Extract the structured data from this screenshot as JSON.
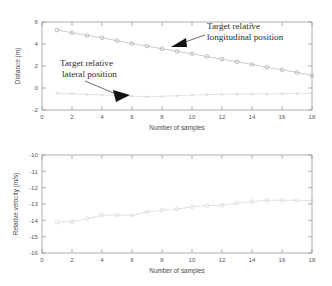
{
  "figure": {
    "background_color": "#ffffff",
    "panels": 2
  },
  "chart_data": [
    {
      "type": "line",
      "title": "",
      "xlabel": "Number of samples",
      "ylabel": "Distance (m)",
      "xlim": [
        0,
        18
      ],
      "ylim": [
        -2,
        6
      ],
      "xticks": [
        0,
        2,
        4,
        6,
        8,
        10,
        12,
        14,
        16,
        18
      ],
      "xticklabels": [
        "0",
        "2",
        "4",
        "6",
        "8",
        "10",
        "12",
        "14",
        "16",
        "18"
      ],
      "yticks": [
        -2,
        0,
        2,
        4,
        6
      ],
      "yticklabels": [
        "-2",
        "0",
        "2",
        "4",
        "6"
      ],
      "grid": false,
      "legend": "annotations",
      "marker": "circle",
      "x": [
        1,
        2,
        3,
        4,
        5,
        6,
        7,
        8,
        9,
        10,
        11,
        12,
        13,
        14,
        15,
        16,
        17,
        18
      ],
      "series": [
        {
          "name": "Target relative longitudinal position",
          "color": "#a8a8a8",
          "values": [
            5.27,
            5.02,
            4.78,
            4.56,
            4.3,
            4.04,
            3.81,
            3.57,
            3.33,
            3.11,
            2.86,
            2.62,
            2.38,
            2.15,
            1.88,
            1.65,
            1.42,
            1.13
          ]
        },
        {
          "name": "Target relative lateral position",
          "color": "#cdcdcd",
          "values": [
            -0.48,
            -0.52,
            -0.58,
            -0.63,
            -0.68,
            -0.74,
            -0.79,
            -0.76,
            -0.7,
            -0.64,
            -0.6,
            -0.57,
            -0.55,
            -0.54,
            -0.53,
            -0.52,
            -0.5,
            -0.48
          ]
        }
      ],
      "annotations": [
        {
          "name": "longitudinal-annotation",
          "line1": "Target  relative",
          "line2": "longitudinal position",
          "points_to_series": "Target relative longitudinal position"
        },
        {
          "name": "lateral-annotation",
          "line1": "Target  relative",
          "line2": "lateral  position",
          "points_to_series": "Target relative lateral position"
        }
      ]
    },
    {
      "type": "line",
      "title": "",
      "xlabel": "Number of samples",
      "ylabel": "Relative velocity (m/s)",
      "xlim": [
        0,
        18
      ],
      "ylim": [
        -16,
        -10
      ],
      "xticks": [
        0,
        2,
        4,
        6,
        8,
        10,
        12,
        14,
        16,
        18
      ],
      "xticklabels": [
        "0",
        "2",
        "4",
        "6",
        "8",
        "10",
        "12",
        "14",
        "16",
        "18"
      ],
      "yticks": [
        -16,
        -15,
        -14,
        -13,
        -12,
        -11,
        -10
      ],
      "yticklabels": [
        "-16",
        "-15",
        "-14",
        "-13",
        "-12",
        "-11",
        "-10"
      ],
      "grid": false,
      "legend": "none",
      "marker": "circle",
      "x": [
        1,
        2,
        3,
        4,
        5,
        6,
        7,
        8,
        9,
        10,
        11,
        12,
        13,
        14,
        15,
        16,
        17,
        18
      ],
      "series": [
        {
          "name": "Relative velocity",
          "color": "#c8c8c8",
          "values": [
            -14.1,
            -14.08,
            -13.9,
            -13.68,
            -13.67,
            -13.7,
            -13.48,
            -13.38,
            -13.3,
            -13.18,
            -13.1,
            -13.08,
            -12.95,
            -12.86,
            -12.77,
            -12.77,
            -12.77,
            -12.8
          ]
        }
      ],
      "annotations": []
    }
  ]
}
